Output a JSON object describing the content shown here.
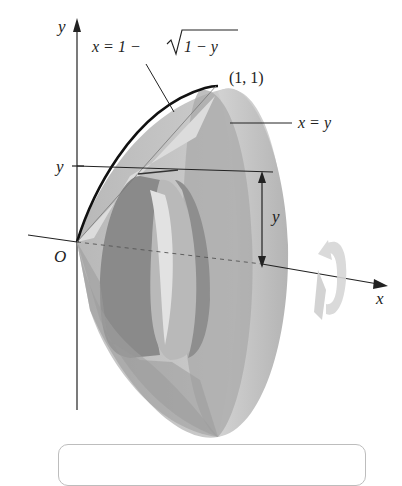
{
  "figure": {
    "type": "solid-of-revolution",
    "axis_labels": {
      "x": "x",
      "y": "y",
      "origin": "O"
    },
    "tick_label_y": "y",
    "curve_label_outer": "x = 1 − √(1 − y)",
    "curve_label_outer_parts": {
      "lhs": "x = 1 − ",
      "radicand": "1 − y"
    },
    "curve_label_inner": "x = y",
    "point_label": "(1, 1)",
    "radius_label": "y",
    "rotation_axis": "x",
    "colors": {
      "outer_surface": "#c9c9c9",
      "inner_surface": "#9a9a9a",
      "dark_shell": "#8c8c8c",
      "light_face": "#dadada",
      "rotation_arrow": "#d3d3d3",
      "curve": "#111111"
    }
  },
  "caption_box": {
    "text": ""
  }
}
